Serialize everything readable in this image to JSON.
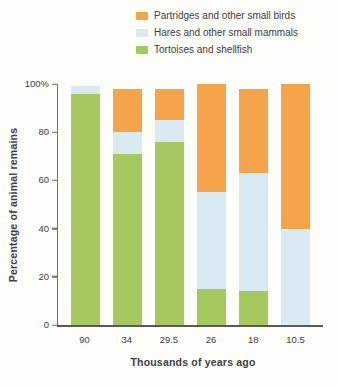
{
  "chart_data": {
    "type": "bar",
    "stacked": true,
    "title": "",
    "xlabel": "Thousands of years ago",
    "ylabel": "Percentage of animal remains",
    "categories": [
      "90",
      "34",
      "29.5",
      "26",
      "18",
      "10.5"
    ],
    "series": [
      {
        "name": "Tortoises and shellfish",
        "color": "#a5c95f",
        "values": [
          96,
          71,
          76,
          15,
          14,
          0
        ]
      },
      {
        "name": "Hares and other small mammals",
        "color": "#d9eaf3",
        "values": [
          3,
          9,
          9,
          40,
          49,
          40
        ]
      },
      {
        "name": "Partridges and other small birds",
        "color": "#f6a44c",
        "values": [
          0,
          18,
          13,
          45,
          35,
          60
        ]
      }
    ],
    "stack_totals": [
      99,
      98,
      98,
      100,
      98,
      100
    ],
    "ylim": [
      0,
      100
    ],
    "yticks": [
      {
        "value": 0,
        "label": "0"
      },
      {
        "value": 20,
        "label": "20"
      },
      {
        "value": 40,
        "label": "40"
      },
      {
        "value": 60,
        "label": "60"
      },
      {
        "value": 80,
        "label": "80"
      },
      {
        "value": 100,
        "label": "100%"
      }
    ],
    "grid": false,
    "legend_position": "top-right",
    "legend_order_top_to_bottom": [
      "Partridges and other small birds",
      "Hares and other small mammals",
      "Tortoises and shellfish"
    ]
  },
  "colors": {
    "axis_line": "#6d6e71",
    "text": "#414042",
    "background": "#fdfdfa"
  }
}
